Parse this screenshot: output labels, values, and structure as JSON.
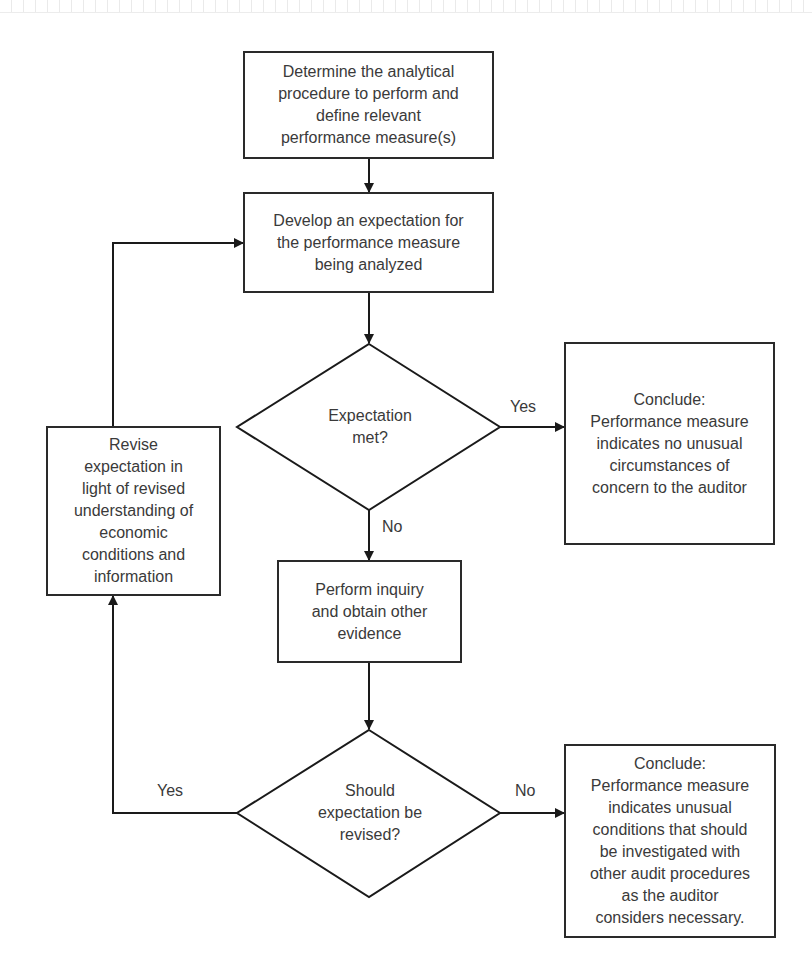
{
  "diagram": {
    "type": "flowchart",
    "colors": {
      "stroke": "#2a2a2a",
      "text": "#3a3a3a",
      "background": "#ffffff"
    },
    "nodes": {
      "determine": {
        "shape": "rectangle",
        "label": "Determine the analytical\nprocedure to perform and\ndefine relevant\nperformance measure(s)"
      },
      "develop": {
        "shape": "rectangle",
        "label": "Develop an expectation for\nthe performance measure\nbeing analyzed"
      },
      "expectation_met": {
        "shape": "diamond",
        "label": "Expectation\nmet?"
      },
      "conclude_no_unusual": {
        "shape": "rectangle",
        "label": "Conclude:\nPerformance measure\nindicates no unusual\ncircumstances of\nconcern to the auditor"
      },
      "revise": {
        "shape": "rectangle",
        "label": "Revise\nexpectation in\nlight of revised\nunderstanding of\neconomic\nconditions and\ninformation"
      },
      "inquiry": {
        "shape": "rectangle",
        "label": "Perform inquiry\nand obtain other\nevidence"
      },
      "should_revise": {
        "shape": "diamond",
        "label": "Should\nexpectation be\nrevised?"
      },
      "conclude_unusual": {
        "shape": "rectangle",
        "label": "Conclude:\nPerformance measure\nindicates unusual\nconditions that should\nbe investigated with\nother audit procedures\nas the auditor\nconsiders necessary."
      }
    },
    "edges": [
      {
        "from": "determine",
        "to": "develop",
        "label": ""
      },
      {
        "from": "develop",
        "to": "expectation_met",
        "label": ""
      },
      {
        "from": "expectation_met",
        "to": "conclude_no_unusual",
        "label": "Yes"
      },
      {
        "from": "expectation_met",
        "to": "inquiry",
        "label": "No"
      },
      {
        "from": "inquiry",
        "to": "should_revise",
        "label": ""
      },
      {
        "from": "should_revise",
        "to": "conclude_unusual",
        "label": "No"
      },
      {
        "from": "should_revise",
        "to": "revise",
        "label": "Yes"
      },
      {
        "from": "revise",
        "to": "develop",
        "label": ""
      }
    ],
    "edge_labels": {
      "met_yes": "Yes",
      "met_no": "No",
      "revise_yes": "Yes",
      "revise_no": "No"
    }
  }
}
